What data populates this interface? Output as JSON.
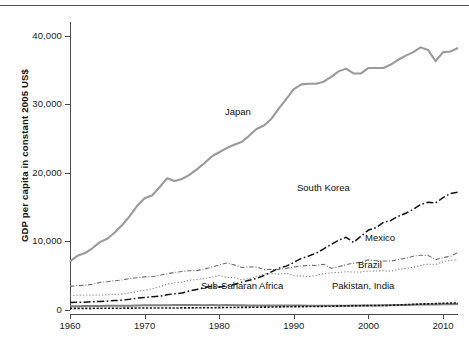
{
  "chart_data": {
    "type": "line",
    "title": "",
    "xlabel": "",
    "ylabel": "GDP per capita in constant 2005 US$",
    "xlim": [
      1960,
      2012
    ],
    "ylim": [
      0,
      42000
    ],
    "grid": false,
    "legend_position": "inline-annotations",
    "xticks": [
      1960,
      1970,
      1980,
      1990,
      2000,
      2010
    ],
    "xtick_labels": [
      "1960",
      "1970",
      "1980",
      "1990",
      "2000",
      "2010"
    ],
    "yticks": [
      0,
      10000,
      20000,
      30000,
      40000
    ],
    "ytick_labels": [
      "0",
      "10,000",
      "20,000",
      "30,000",
      "40,000"
    ],
    "x": [
      1960,
      1961,
      1962,
      1963,
      1964,
      1965,
      1966,
      1967,
      1968,
      1969,
      1970,
      1971,
      1972,
      1973,
      1974,
      1975,
      1976,
      1977,
      1978,
      1979,
      1980,
      1981,
      1982,
      1983,
      1984,
      1985,
      1986,
      1987,
      1988,
      1989,
      1990,
      1991,
      1992,
      1993,
      1994,
      1995,
      1996,
      1997,
      1998,
      1999,
      2000,
      2001,
      2002,
      2003,
      2004,
      2005,
      2006,
      2007,
      2008,
      2009,
      2010,
      2011,
      2012
    ],
    "series": [
      {
        "name": "Japan",
        "color": "#9a9a9a",
        "style": "solid",
        "width": 2.1,
        "values": [
          7100,
          7900,
          8300,
          9000,
          9900,
          10400,
          11300,
          12400,
          13700,
          15200,
          16300,
          16700,
          17900,
          19200,
          18800,
          19100,
          19700,
          20500,
          21400,
          22400,
          23000,
          23600,
          24100,
          24500,
          25400,
          26400,
          26900,
          27900,
          29400,
          30800,
          32200,
          32900,
          33000,
          33000,
          33300,
          34000,
          34800,
          35200,
          34500,
          34500,
          35300,
          35300,
          35300,
          35800,
          36500,
          37100,
          37600,
          38300,
          37900,
          36300,
          37600,
          37700,
          38200
        ]
      },
      {
        "name": "South Korea",
        "color": "#111111",
        "style": "dashdot",
        "width": 1.5,
        "values": [
          1110,
          1130,
          1140,
          1200,
          1250,
          1290,
          1380,
          1440,
          1570,
          1730,
          1840,
          1930,
          2000,
          2220,
          2370,
          2470,
          2770,
          3000,
          3250,
          3460,
          3330,
          3520,
          3720,
          4060,
          4340,
          4600,
          5030,
          5570,
          6110,
          6400,
          6940,
          7530,
          7880,
          8290,
          8900,
          9560,
          10180,
          10600,
          9860,
          10770,
          11660,
          12010,
          12770,
          13060,
          13670,
          14100,
          14700,
          15400,
          15700,
          15600,
          16400,
          17000,
          17200
        ]
      },
      {
        "name": "Mexico",
        "color": "#6e6e6e",
        "style": "dashdot-fine",
        "width": 1.1,
        "values": [
          3450,
          3540,
          3600,
          3760,
          4010,
          4130,
          4270,
          4380,
          4580,
          4710,
          4830,
          4860,
          5060,
          5290,
          5470,
          5620,
          5730,
          5740,
          5960,
          6270,
          6570,
          6860,
          6580,
          6200,
          6280,
          6290,
          5890,
          5920,
          5900,
          6070,
          6280,
          6410,
          6510,
          6500,
          6670,
          6090,
          6310,
          6620,
          6840,
          6950,
          7310,
          7180,
          7140,
          7140,
          7370,
          7550,
          7850,
          7990,
          7960,
          7330,
          7640,
          7830,
          8400
        ]
      },
      {
        "name": "Brazil",
        "color": "#8a8a8a",
        "style": "dotted-fine",
        "width": 1.1,
        "values": [
          2050,
          2150,
          2200,
          2160,
          2190,
          2200,
          2290,
          2320,
          2510,
          2690,
          2880,
          3110,
          3380,
          3740,
          3970,
          4060,
          4350,
          4440,
          4570,
          4810,
          5050,
          4760,
          4700,
          4400,
          4590,
          4880,
          5260,
          5320,
          5220,
          5340,
          5000,
          4970,
          4850,
          5060,
          5290,
          5420,
          5480,
          5580,
          5540,
          5530,
          5700,
          5680,
          5730,
          5660,
          5940,
          6050,
          6230,
          6510,
          6700,
          6610,
          7050,
          7250,
          7300
        ]
      },
      {
        "name": "Sub-Saharan Africa",
        "color": "#7f7f7f",
        "style": "solid",
        "width": 2.0,
        "values": [
          560,
          565,
          575,
          590,
          600,
          615,
          620,
          615,
          630,
          660,
          685,
          695,
          700,
          710,
          730,
          715,
          720,
          725,
          710,
          715,
          710,
          715,
          700,
          675,
          665,
          670,
          665,
          655,
          660,
          665,
          655,
          645,
          625,
          615,
          610,
          615,
          625,
          635,
          640,
          645,
          655,
          665,
          675,
          690,
          715,
          740,
          765,
          795,
          820,
          805,
          830,
          850,
          865
        ]
      },
      {
        "name": "Pakistan, India",
        "color": "#141414",
        "style": "dotted",
        "width": 1.6,
        "values": [
          230,
          232,
          235,
          245,
          255,
          250,
          252,
          265,
          272,
          283,
          292,
          288,
          285,
          293,
          297,
          305,
          305,
          318,
          333,
          330,
          343,
          360,
          368,
          383,
          390,
          402,
          415,
          430,
          455,
          472,
          487,
          492,
          505,
          512,
          530,
          553,
          572,
          581,
          602,
          628,
          645,
          652,
          662,
          692,
          735,
          782,
          830,
          883,
          900,
          932,
          975,
          1010,
          1040
        ]
      }
    ],
    "annotations": [
      {
        "text": "Japan",
        "x": 225,
        "y": 107
      },
      {
        "text": "South Korea",
        "x": 297,
        "y": 183
      },
      {
        "text": "Mexico",
        "x": 365,
        "y": 233
      },
      {
        "text": "Brazil",
        "x": 358,
        "y": 260
      },
      {
        "text": "Sub-Saharan Africa",
        "x": 201,
        "y": 281
      },
      {
        "text": "Pakistan, India",
        "x": 332,
        "y": 281
      }
    ]
  }
}
